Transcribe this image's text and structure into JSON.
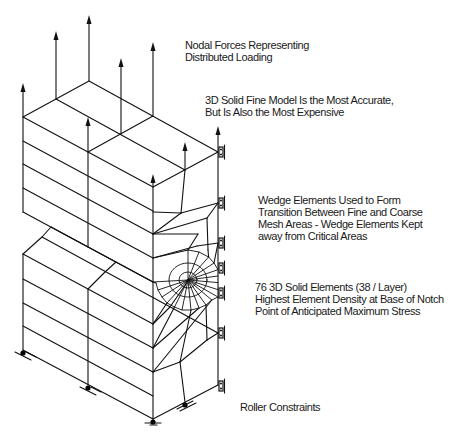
{
  "figure": {
    "annotations": {
      "nodal_forces": {
        "lines": [
          "Nodal Forces Representing",
          "Distributed Loading"
        ]
      },
      "fine_model": {
        "lines": [
          "3D Solid Fine Model Is the Most Accurate,",
          "But Is Also the Most Expensive"
        ]
      },
      "wedge_elements": {
        "lines": [
          "Wedge Elements Used to Form",
          "Transition Between Fine and Coarse",
          "Mesh Areas - Wedge Elements Kept",
          "away from Critical Areas"
        ]
      },
      "solid_elements": {
        "lines": [
          "76 3D Solid Elements (38 / Layer)",
          "Highest Element Density at Base of Notch",
          "Point of Anticipated Maximum Stress"
        ]
      },
      "roller_constraints": {
        "lines": [
          "Roller Constraints"
        ]
      }
    },
    "colors": {
      "line": "#111111",
      "background": "#ffffff"
    }
  }
}
